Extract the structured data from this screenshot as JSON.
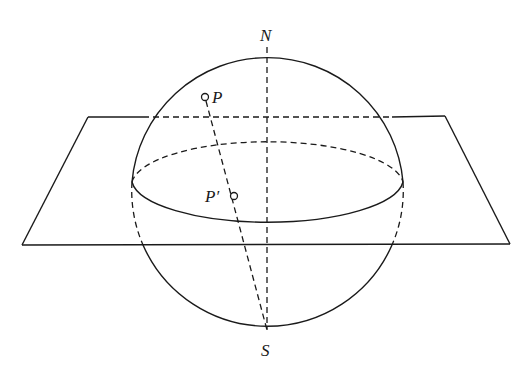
{
  "figure": {
    "type": "stereographic-projection",
    "labels": {
      "north": "N",
      "south": "S",
      "point": "P",
      "projection": "P′"
    },
    "colors": {
      "stroke": "#1a1a1a",
      "background": "#ffffff"
    }
  }
}
